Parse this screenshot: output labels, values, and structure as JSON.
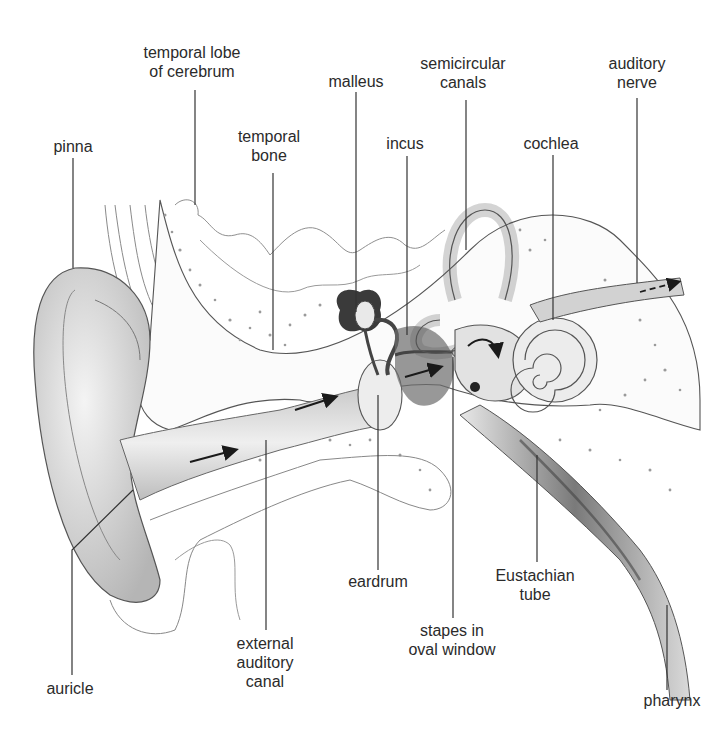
{
  "diagram": {
    "type": "anatomical-illustration",
    "colors": {
      "ink": "#2b2b2b",
      "shade": "#9a9a9a",
      "background": "#ffffff"
    }
  },
  "labels": {
    "temporal_lobe": {
      "line1": "temporal lobe",
      "line2": "of cerebrum"
    },
    "malleus": {
      "line1": "malleus"
    },
    "semicircular_canals": {
      "line1": "semicircular",
      "line2": "canals"
    },
    "auditory_nerve": {
      "line1": "auditory",
      "line2": "nerve"
    },
    "pinna": {
      "line1": "pinna"
    },
    "temporal_bone": {
      "line1": "temporal",
      "line2": "bone"
    },
    "incus": {
      "line1": "incus"
    },
    "cochlea": {
      "line1": "cochlea"
    },
    "eardrum": {
      "line1": "eardrum"
    },
    "eustachian_tube": {
      "line1": "Eustachian",
      "line2": "tube"
    },
    "stapes": {
      "line1": "stapes in",
      "line2": "oval window"
    },
    "external_canal": {
      "line1": "external",
      "line2": "auditory",
      "line3": "canal"
    },
    "auricle": {
      "line1": "auricle"
    },
    "pharynx": {
      "line1": "pharynx"
    }
  }
}
